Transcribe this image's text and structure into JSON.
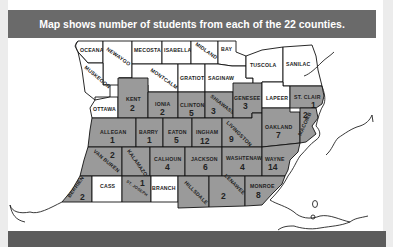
{
  "header": {
    "title": "Map shows number of students from each of the 22 counties."
  },
  "colors": {
    "shaded": "#9a9a9a",
    "unshaded": "#ffffff",
    "header_bg": "#6a6a6a",
    "border": "#111111"
  },
  "counties": {
    "oceana": {
      "name": "OCEANA",
      "students": null
    },
    "newaygo": {
      "name": "NEWAYGO",
      "students": null
    },
    "mecosta": {
      "name": "MECOSTA",
      "students": null
    },
    "isabella": {
      "name": "ISABELLA",
      "students": null
    },
    "midland": {
      "name": "MIDLAND",
      "students": null
    },
    "bay": {
      "name": "BAY",
      "students": null
    },
    "muskegon": {
      "name": "MUSKEGON",
      "students": null
    },
    "montcalm": {
      "name": "MONTCALM",
      "students": null
    },
    "gratiot": {
      "name": "GRATIOT",
      "students": null
    },
    "saginaw": {
      "name": "SAGINAW",
      "students": null
    },
    "tuscola": {
      "name": "TUSCOLA",
      "students": null
    },
    "sanilac": {
      "name": "SANILAC",
      "students": null
    },
    "ottawa": {
      "name": "OTTAWA",
      "students": null
    },
    "kent": {
      "name": "KENT",
      "students": "2"
    },
    "ionia": {
      "name": "IONIA",
      "students": "2"
    },
    "clinton": {
      "name": "CLINTON",
      "students": "5"
    },
    "shiawassee": {
      "name": "SHIAWASSEE",
      "students": "3"
    },
    "genesee": {
      "name": "GENESEE",
      "students": "3"
    },
    "lapeer": {
      "name": "LAPEER",
      "students": null
    },
    "st_clair": {
      "name": "ST. CLAIR",
      "students": "1"
    },
    "allegan": {
      "name": "ALLEGAN",
      "students": "1"
    },
    "barry": {
      "name": "BARRY",
      "students": "1"
    },
    "eaton": {
      "name": "EATON",
      "students": "5"
    },
    "ingham": {
      "name": "INGHAM",
      "students": "12"
    },
    "livingston": {
      "name": "LIVINGSTON",
      "students": "9"
    },
    "oakland": {
      "name": "OAKLAND",
      "students": "7"
    },
    "macomb": {
      "name": "MACOMB",
      "students": "2"
    },
    "van_buren": {
      "name": "VAN BUREN",
      "students": "2"
    },
    "kalamazoo": {
      "name": "KALAMAZOO",
      "students": null
    },
    "calhoun": {
      "name": "CALHOUN",
      "students": "4"
    },
    "jackson": {
      "name": "JACKSON",
      "students": "6"
    },
    "washtenaw": {
      "name": "WASHTENAW",
      "students": "4"
    },
    "wayne": {
      "name": "WAYNE",
      "students": "14"
    },
    "berrien": {
      "name": "BERRIEN",
      "students": "2"
    },
    "cass": {
      "name": "CASS",
      "students": null
    },
    "st_joseph": {
      "name": "ST. JOSEPH",
      "students": "1"
    },
    "branch": {
      "name": "BRANCH",
      "students": null
    },
    "hillsdale": {
      "name": "HILLSDALE",
      "students": null
    },
    "lenawee": {
      "name": "LENAWEE",
      "students": "2"
    },
    "monroe": {
      "name": "MONROE",
      "students": "8"
    }
  }
}
